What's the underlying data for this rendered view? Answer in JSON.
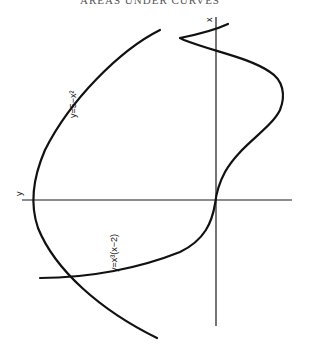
{
  "caption": "AREAS UNDER CURVES",
  "axes": {
    "horizontal_label": "y",
    "vertical_label": "x"
  },
  "curves": [
    {
      "id": "parabola",
      "label": "y=5−x²",
      "color": "#111111"
    },
    {
      "id": "quartic",
      "label": "y=x³(x−2)",
      "color": "#111111"
    }
  ]
}
